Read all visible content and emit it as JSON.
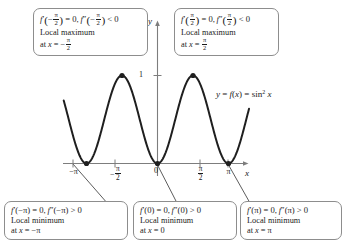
{
  "figure": {
    "function_label": "y = f(x) = sin² x",
    "axis_x_label": "x",
    "axis_y_label": "y",
    "y_tick_label": "1"
  },
  "x_ticks": [
    {
      "label": "-pi",
      "text": "−π",
      "value": -3.14159
    },
    {
      "label": "-pi/2",
      "text": "−π/2",
      "value": -1.5708
    },
    {
      "label": "0",
      "text": "0",
      "value": 0
    },
    {
      "label": "pi/2",
      "text": "π/2",
      "value": 1.5708
    },
    {
      "label": "pi",
      "text": "π",
      "value": 3.14159
    }
  ],
  "callouts": {
    "top_left": {
      "formula_plain": "f'(−π/2) = 0, f''(−π/2) < 0",
      "line2": "Local maximum",
      "line3_plain": "at x = −π/2"
    },
    "top_right": {
      "formula_plain": "f'(π/2) = 0, f''(π/2) < 0",
      "line2": "Local maximum",
      "line3_plain": "at x = π/2"
    },
    "bottom_left": {
      "formula_plain": "f'(−π) = 0, f''(−π) > 0",
      "line2": "Local minimum",
      "line3_plain": "at x = −π"
    },
    "bottom_middle": {
      "formula_plain": "f'(0) = 0, f''(0) > 0",
      "line2": "Local minimum",
      "line3_plain": "at x = 0"
    },
    "bottom_right": {
      "formula_plain": "f'(π) = 0, f''(π) > 0",
      "line2": "Local minimum",
      "line3_plain": "at x = π"
    }
  },
  "chart_data": {
    "type": "line",
    "title": "",
    "xlabel": "x",
    "ylabel": "y",
    "expression": "y = sin^2(x)",
    "xlim": [
      -4.15,
      4.05
    ],
    "ylim": [
      -0.28,
      1.22
    ],
    "grid": false,
    "legend": null,
    "series": [
      {
        "name": "f(x) = sin^2 x",
        "x": [
          -4.15,
          -3.9,
          -3.65,
          -3.4,
          -3.14159,
          -2.9,
          -2.65,
          -2.4,
          -2.15,
          -1.9,
          -1.5708,
          -1.3,
          -1.05,
          -0.8,
          -0.55,
          -0.3,
          0,
          0.3,
          0.55,
          0.8,
          1.05,
          1.3,
          1.5708,
          1.9,
          2.15,
          2.4,
          2.65,
          2.9,
          3.14159,
          3.4,
          3.65,
          3.9,
          4.05
        ],
        "y": [
          0.74,
          0.451,
          0.232,
          0.068,
          0.0,
          0.055,
          0.229,
          0.456,
          0.7,
          0.895,
          1.0,
          0.928,
          0.757,
          0.515,
          0.272,
          0.087,
          0.0,
          0.087,
          0.272,
          0.515,
          0.757,
          0.928,
          1.0,
          0.895,
          0.7,
          0.456,
          0.229,
          0.055,
          0.0,
          0.068,
          0.232,
          0.451,
          0.631
        ]
      }
    ],
    "marked_points": [
      {
        "x": -3.14159,
        "y": 0,
        "kind": "local minimum",
        "label": "x = -pi"
      },
      {
        "x": -1.5708,
        "y": 1,
        "kind": "local maximum",
        "label": "x = -pi/2"
      },
      {
        "x": 0,
        "y": 0,
        "kind": "local minimum",
        "label": "x = 0"
      },
      {
        "x": 1.5708,
        "y": 1,
        "kind": "local maximum",
        "label": "x = pi/2"
      },
      {
        "x": 3.14159,
        "y": 0,
        "kind": "local minimum",
        "label": "x = pi"
      }
    ],
    "y_ticks": [
      1
    ]
  },
  "colors": {
    "curve": "#1f1f1f",
    "axis": "#7d7d7d",
    "box_border": "#8d8d8d",
    "text": "#1a1a1a",
    "leader": "#4a4a4a"
  }
}
